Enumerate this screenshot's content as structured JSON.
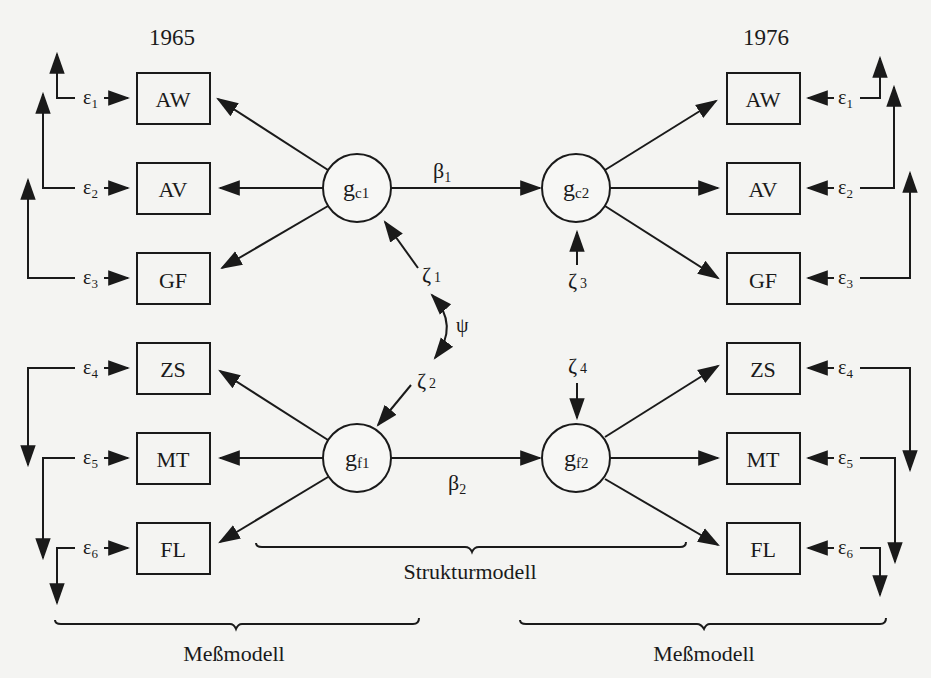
{
  "years": {
    "left": "1965",
    "right": "1976"
  },
  "indicators": [
    "AW",
    "AV",
    "GF",
    "ZS",
    "MT",
    "FL"
  ],
  "errors_left": [
    {
      "sym": "ε",
      "sub": "1"
    },
    {
      "sym": "ε",
      "sub": "2"
    },
    {
      "sym": "ε",
      "sub": "3"
    },
    {
      "sym": "ε",
      "sub": "4"
    },
    {
      "sym": "ε",
      "sub": "5"
    },
    {
      "sym": "ε",
      "sub": "6"
    }
  ],
  "errors_right": [
    {
      "sym": "ε",
      "sub": "1"
    },
    {
      "sym": "ε",
      "sub": "2"
    },
    {
      "sym": "ε",
      "sub": "3"
    },
    {
      "sym": "ε",
      "sub": "4"
    },
    {
      "sym": "ε",
      "sub": "5"
    },
    {
      "sym": "ε",
      "sub": "6"
    }
  ],
  "latents": {
    "gc1": {
      "sym": "g",
      "sub": "c1"
    },
    "gc2": {
      "sym": "g",
      "sub": "c2"
    },
    "gf1": {
      "sym": "g",
      "sub": "f1"
    },
    "gf2": {
      "sym": "g",
      "sub": "f2"
    }
  },
  "paths": {
    "beta1": {
      "sym": "β",
      "sub": "1"
    },
    "beta2": {
      "sym": "β",
      "sub": "2"
    }
  },
  "disturbances": {
    "zeta1": {
      "sym": "ζ",
      "sub": "1"
    },
    "zeta2": {
      "sym": "ζ",
      "sub": "2"
    },
    "zeta3": {
      "sym": "ζ",
      "sub": "3"
    },
    "zeta4": {
      "sym": "ζ",
      "sub": "4"
    }
  },
  "covariance": {
    "sym": "ψ"
  },
  "braces": {
    "structural": "Strukturmodell",
    "measurement_left": "Meßmodell",
    "measurement_right": "Meßmodell"
  }
}
